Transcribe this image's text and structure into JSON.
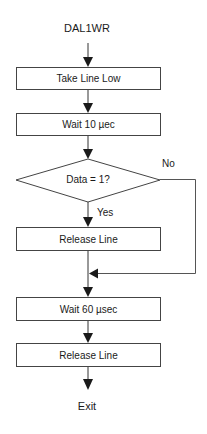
{
  "flowchart": {
    "start": "DAL1WR",
    "steps": [
      {
        "id": "take-line-low",
        "type": "process",
        "label": "Take Line Low"
      },
      {
        "id": "wait-10",
        "type": "process",
        "label": "Wait 10 µec"
      },
      {
        "id": "data-check",
        "type": "decision",
        "label": "Data = 1?",
        "yes_label": "Yes",
        "no_label": "No"
      },
      {
        "id": "release-line-1",
        "type": "process",
        "label": "Release Line"
      },
      {
        "id": "wait-60",
        "type": "process",
        "label": "Wait 60 µsec"
      },
      {
        "id": "release-line-2",
        "type": "process",
        "label": "Release Line"
      }
    ],
    "end": "Exit"
  },
  "colors": {
    "line": "#333333",
    "border": "#444444",
    "background": "#ffffff",
    "text": "#1a1a1a"
  }
}
